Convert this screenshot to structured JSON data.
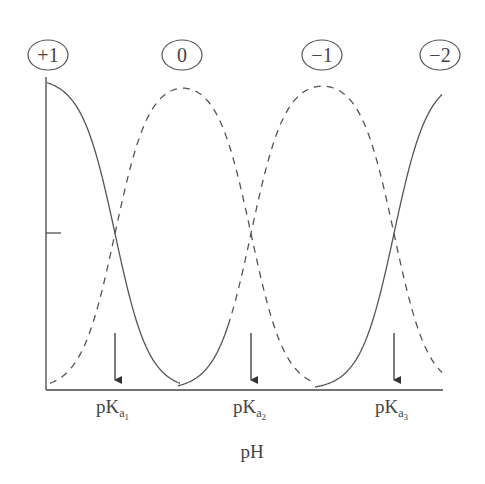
{
  "header": {
    "cut_off_text": ""
  },
  "chart_data": {
    "type": "line",
    "title": "",
    "xlabel": "pH",
    "ylabel": "",
    "grid": false,
    "legend_position": "top (circled charge labels above each species peak)",
    "species": [
      {
        "label": "+1",
        "peak_x_px": 48
      },
      {
        "label": "0",
        "peak_x_px": 182
      },
      {
        "label": "−1",
        "peak_x_px": 322
      },
      {
        "label": "−2",
        "peak_x_px": 440
      }
    ],
    "x_ticks": [
      {
        "label_main": "pK",
        "label_sub": "a",
        "label_subsub": "1",
        "x_px": 115
      },
      {
        "label_main": "pK",
        "label_sub": "a",
        "label_subsub": "2",
        "x_px": 251
      },
      {
        "label_main": "pK",
        "label_sub": "a",
        "label_subsub": "3",
        "x_px": 394
      }
    ],
    "y_ticks": [
      {
        "label": "",
        "value": 0.5
      }
    ],
    "ylim": [
      0,
      1
    ],
    "series": [
      {
        "name": "+1",
        "style": "solid",
        "description": "fraction 1 at low pH, 0.5 at pKa1, ~0 by midpoint between pKa1 and pKa2"
      },
      {
        "name": "0",
        "style": "dashed",
        "description": "rises from 0, 0.5 at pKa1, peak ~1 between pKa1 and pKa2, 0.5 at pKa2, falls to 0"
      },
      {
        "name": "−1",
        "style": "solid→dashed",
        "description": "rises from 0 after pKa1 region, 0.5 at pKa2, peak ~1 between pKa2 and pKa3, 0.5 at pKa3, falls"
      },
      {
        "name": "−2",
        "style": "solid",
        "description": "rises from 0, 0.5 at pKa3, approaching ~0.95 at right edge"
      }
    ]
  },
  "geometry": {
    "axis": {
      "x0": 46,
      "y_top": 77,
      "y_bottom": 390,
      "x_end": 443,
      "tick_y": 233
    },
    "arrows": {
      "y_start": 333,
      "y_end": 388
    },
    "labels_y": 55
  }
}
